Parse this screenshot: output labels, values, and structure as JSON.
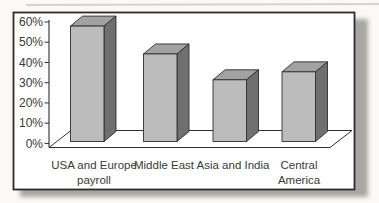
{
  "chart_data": {
    "type": "bar",
    "variant": "3d-column",
    "title": "",
    "legend": "none",
    "grid": "off",
    "unit": "%",
    "categories": [
      "USA and Europe payroll",
      "Middle East",
      "Asia and India",
      "Central America"
    ],
    "category_lines": [
      [
        "USA and Europe",
        "payroll"
      ],
      [
        "Middle East"
      ],
      [
        "Asia and India"
      ],
      [
        "Central",
        "America"
      ]
    ],
    "values": [
      58,
      44,
      31,
      35
    ],
    "y_axis": {
      "min": 0,
      "max": 60,
      "step": 10,
      "tick_labels": [
        "0%",
        "10%",
        "20%",
        "30%",
        "40%",
        "50%",
        "60%"
      ]
    },
    "colors": {
      "bar_front": "#bcbcbc",
      "bar_top": "#a2a2a2",
      "bar_side": "#6f6f6f",
      "outline": "#2f2f2f",
      "frame_border": "#2b2b2b",
      "plot_background": "#ffffff",
      "shadow": "#a8a7a3",
      "text": "#3a3a3a"
    }
  }
}
